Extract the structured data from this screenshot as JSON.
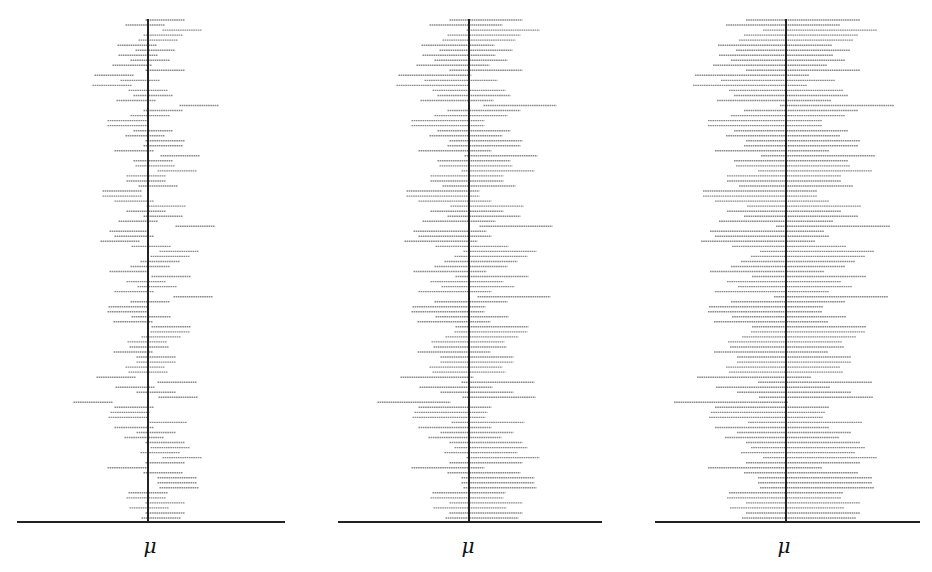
{
  "chart_data": {
    "type": "interval",
    "title": "",
    "xlabel_symbol": "μ",
    "n_intervals_per_panel": 100,
    "row_top_y": 20,
    "row_bottom_y": 518,
    "baseline_y": 522,
    "line_color": "#8a8a8a",
    "axis_color": "#222222",
    "center_offsets_px": [
      17,
      -3,
      34,
      15,
      10,
      -11,
      7,
      -10,
      2,
      -16,
      17,
      -34,
      -8,
      -36,
      0,
      5,
      -12,
      51,
      15,
      2,
      -21,
      -21,
      5,
      -3,
      17,
      15,
      -14,
      32,
      5,
      7,
      29,
      -2,
      -2,
      10,
      -26,
      -26,
      -14,
      18,
      -2,
      15,
      -10,
      47,
      -19,
      -14,
      -28,
      3,
      31,
      22,
      12,
      2,
      -19,
      23,
      -2,
      9,
      -14,
      45,
      2,
      -20,
      -21,
      3,
      -15,
      23,
      22,
      13,
      -1,
      1,
      -15,
      8,
      8,
      -3,
      0,
      -32,
      29,
      -13,
      8,
      30,
      -55,
      -14,
      -18,
      -20,
      19,
      -14,
      8,
      -4,
      17,
      22,
      12,
      34,
      17,
      -21,
      15,
      29,
      29,
      31,
      0,
      -2,
      17,
      1,
      17,
      13
    ],
    "panels": [
      {
        "id": "panel-1",
        "center_x": 148,
        "half_width": 19.5,
        "axis_x0": 17,
        "axis_x1": 285,
        "label": "μ",
        "label_x": 150
      },
      {
        "id": "panel-2",
        "center_x": 469,
        "half_width": 36.5,
        "axis_x0": 338,
        "axis_x1": 602,
        "label": "μ",
        "label_x": 468
      },
      {
        "id": "panel-3",
        "center_x": 786,
        "half_width": 57,
        "axis_x0": 655,
        "axis_x1": 920,
        "label": "μ",
        "label_x": 784
      }
    ]
  }
}
